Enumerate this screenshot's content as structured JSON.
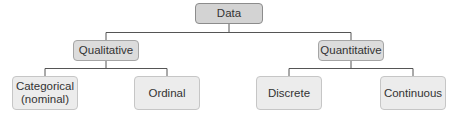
{
  "diagram": {
    "root": {
      "label": "Data"
    },
    "branches": [
      {
        "label": "Qualitative",
        "children": [
          {
            "label": "Categorical\n(nominal)",
            "line1": "Categorical",
            "line2": "(nominal)"
          },
          {
            "label": "Ordinal"
          }
        ]
      },
      {
        "label": "Quantitative",
        "children": [
          {
            "label": "Discrete"
          },
          {
            "label": "Continuous"
          }
        ]
      }
    ]
  },
  "colors": {
    "root_fill": "#d3d3d3",
    "mid_fill": "#dcdcdc",
    "leaf_fill": "#ececec",
    "line": "#555555"
  }
}
